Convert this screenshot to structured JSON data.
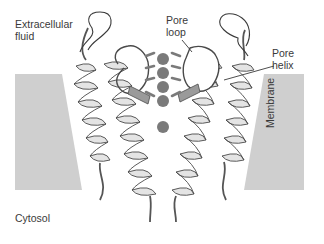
{
  "diagram": {
    "type": "potassium channel pore structure (ribbon diagram)",
    "labels": {
      "extracellular": "Extracellular\nfluid",
      "pore_loop": "Pore\nloop",
      "pore_helix": "Pore\nhelix",
      "membrane": "Membrane",
      "cytosol": "Cytosol"
    },
    "ions": {
      "count": 5,
      "color": "#7a7a7a",
      "positions_y": [
        59,
        73,
        87,
        101,
        127
      ]
    },
    "colors": {
      "membrane_fill": "#cfcfcf",
      "helix_fill": "#e4e4e4",
      "helix_shade": "#9a9a9a",
      "outline": "#4a4a4a",
      "text": "#3a3a3a"
    }
  }
}
